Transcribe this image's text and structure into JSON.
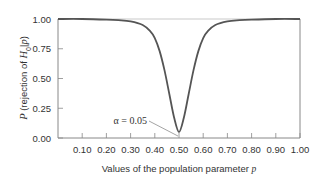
{
  "chart_data": {
    "type": "line",
    "title": "",
    "xlabel": "Values of the population parameter p",
    "xlabel_parts": [
      "Values of the population parameter ",
      "p"
    ],
    "ylabel": "P (rejection of H0|p)",
    "ylabel_parts": [
      "P",
      " (rejection of ",
      "H",
      "0",
      "|",
      "p",
      ")"
    ],
    "xlim": [
      0,
      1
    ],
    "ylim": [
      0,
      1
    ],
    "x_ticks": [
      0.1,
      0.2,
      0.3,
      0.4,
      0.5,
      0.6,
      0.7,
      0.8,
      0.9,
      1.0
    ],
    "x_tick_labels": [
      "0.10",
      "0.20",
      "0.30",
      "0.40",
      "0.50",
      "0.60",
      "0.70",
      "0.80",
      "0.90",
      "1.00"
    ],
    "y_ticks": [
      0.0,
      0.25,
      0.5,
      0.75,
      1.0
    ],
    "y_tick_labels": [
      "0.00",
      "0.25",
      "0.50",
      "0.75",
      "1.00"
    ],
    "grid": false,
    "series": [
      {
        "name": "Power curve",
        "x": [
          0.0,
          0.1,
          0.2,
          0.25,
          0.3,
          0.35,
          0.38,
          0.4,
          0.42,
          0.44,
          0.46,
          0.48,
          0.5,
          0.52,
          0.54,
          0.56,
          0.58,
          0.6,
          0.62,
          0.65,
          0.7,
          0.75,
          0.8,
          0.9,
          1.0
        ],
        "values": [
          1.0,
          1.0,
          0.995,
          0.99,
          0.98,
          0.95,
          0.9,
          0.84,
          0.73,
          0.57,
          0.37,
          0.17,
          0.05,
          0.17,
          0.37,
          0.57,
          0.73,
          0.84,
          0.9,
          0.95,
          0.98,
          0.99,
          0.995,
          1.0,
          1.0
        ]
      }
    ],
    "annotations": [
      {
        "text": "α = 0.05",
        "x": 0.5,
        "y": 0.05
      }
    ],
    "colors": {
      "curve": "#555555",
      "axis": "#888888",
      "text": "#333333"
    }
  }
}
